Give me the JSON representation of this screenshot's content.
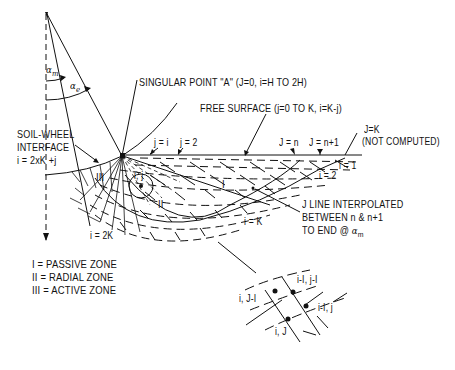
{
  "diagram": {
    "angles": {
      "alpha_m": {
        "symbol": "α",
        "subscript": "m"
      },
      "alpha_e": {
        "symbol": "α",
        "subscript": "e"
      }
    },
    "labels": {
      "singular_point": "SINGULAR POINT \"A\" (J=0, i=H TO 2H)",
      "free_surface": "FREE SURFACE (j=0 TO K, i=K-j)",
      "soil_wheel_line1": "SOIL-WHEEL",
      "soil_wheel_line2": "INTERFACE",
      "soil_wheel_line3": "i = 2xK +j",
      "j_eq_1": "j = i",
      "j_eq_2": "j = 2",
      "j_eq_n": "J = n",
      "j_eq_n1": "J = n+1",
      "j_eq_k_line1": "J=K",
      "j_eq_k_line2": "(NOT COMPUTED)",
      "i_eq_1": "i = 1",
      "i_eq_2": "i = 2",
      "i_eq_k": "i = K",
      "i_eq_2k": "i = 2K",
      "node_ij": "i, j",
      "interp_line1": "J LINE INTERPOLATED",
      "interp_line2": "BETWEEN n & n+1",
      "interp_line3": "TO END @",
      "interp_alpha": "α",
      "interp_alpha_sub": "m"
    },
    "zones": {
      "zone_I": "I",
      "zone_II": "II",
      "zone_III": "III"
    },
    "legend": [
      {
        "key": "I",
        "text": "= PASSIVE ZONE"
      },
      {
        "key": "II",
        "text": "= RADIAL ZONE"
      },
      {
        "key": "III",
        "text": "= ACTIVE ZONE"
      }
    ],
    "detail_nodes": {
      "top": "i-I, j-I",
      "left": "i, J-I",
      "right": "i-I, j",
      "bottom": "i, J"
    }
  }
}
